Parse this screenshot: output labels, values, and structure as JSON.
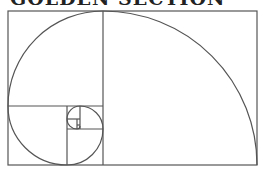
{
  "title": "GOLDEN SECTION",
  "diagram": {
    "type": "golden-spiral",
    "stroke_color": "#555555",
    "background": "#ffffff",
    "outer_rect": {
      "x": 8,
      "y": 11,
      "w": 249,
      "h": 154
    },
    "squares": [
      {
        "x": 103,
        "y": 11,
        "size": 154
      },
      {
        "x": 8,
        "y": 11,
        "size": 95
      },
      {
        "x": 8,
        "y": 106,
        "size": 59
      },
      {
        "x": 67,
        "y": 129,
        "size": 36
      },
      {
        "x": 80,
        "y": 106,
        "size": 23
      },
      {
        "x": 67,
        "y": 106,
        "size": 13
      },
      {
        "x": 67,
        "y": 119,
        "size": 10
      },
      {
        "x": 77,
        "y": 119,
        "size": 3
      }
    ]
  }
}
